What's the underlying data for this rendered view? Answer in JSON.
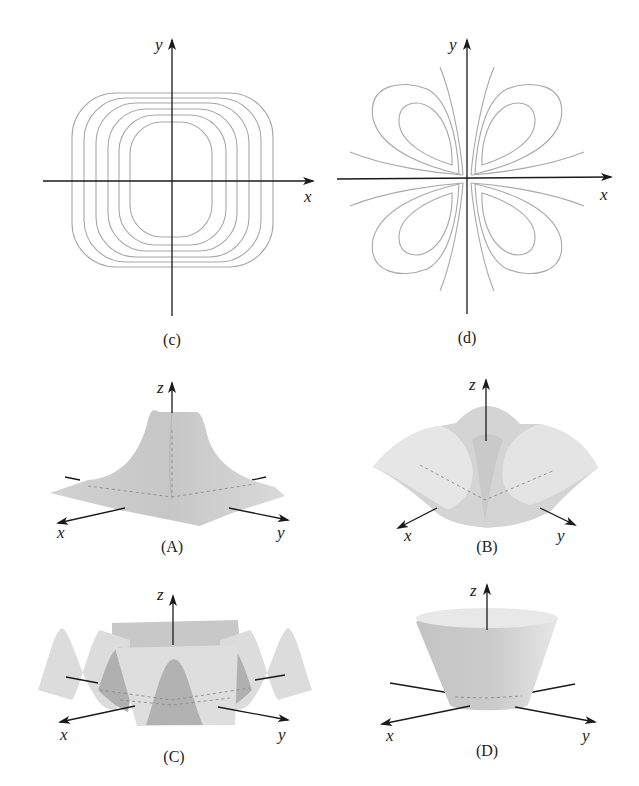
{
  "figure": {
    "panels": [
      {
        "id": "c",
        "caption": "(c)",
        "type": "contour-plot",
        "description": "Nested rounded-square level curves centered at origin",
        "axes": {
          "x": "x",
          "y": "y"
        },
        "contour_count": 6
      },
      {
        "id": "d",
        "caption": "(d)",
        "type": "contour-plot",
        "description": "Four-lobed (clover) level curves, one lobe per quadrant, with hyperbola-like curves near the axes",
        "axes": {
          "x": "x",
          "y": "y"
        }
      },
      {
        "id": "A",
        "caption": "(A)",
        "type": "surface-plot",
        "description": "Spike/peak surface rising sharply at origin, flattening outward",
        "axes": {
          "x": "x",
          "y": "y",
          "z": "z"
        }
      },
      {
        "id": "B",
        "caption": "(B)",
        "type": "surface-plot",
        "description": "Saddle-like surface with ridges along axes and a peak at the center",
        "axes": {
          "x": "x",
          "y": "y",
          "z": "z"
        }
      },
      {
        "id": "C",
        "caption": "(C)",
        "type": "surface-plot",
        "description": "Oscillating wavy surface (sinusoidal ridges)",
        "axes": {
          "x": "x",
          "y": "y",
          "z": "z"
        }
      },
      {
        "id": "D",
        "caption": "(D)",
        "type": "surface-plot",
        "description": "Truncated cone / cup surface opening upward",
        "axes": {
          "x": "x",
          "y": "y",
          "z": "z"
        }
      }
    ]
  },
  "labels": {
    "x": "x",
    "y": "y",
    "z": "z",
    "c": "(c)",
    "d": "(d)",
    "A": "(A)",
    "B": "(B)",
    "C": "(C)",
    "D": "(D)"
  },
  "colors": {
    "contour": "#a8a8a8",
    "axis": "#1a1a1a",
    "surface_light": "#e4e4e4",
    "surface_mid": "#cfcfcf",
    "surface_dark": "#a9a9a9"
  }
}
